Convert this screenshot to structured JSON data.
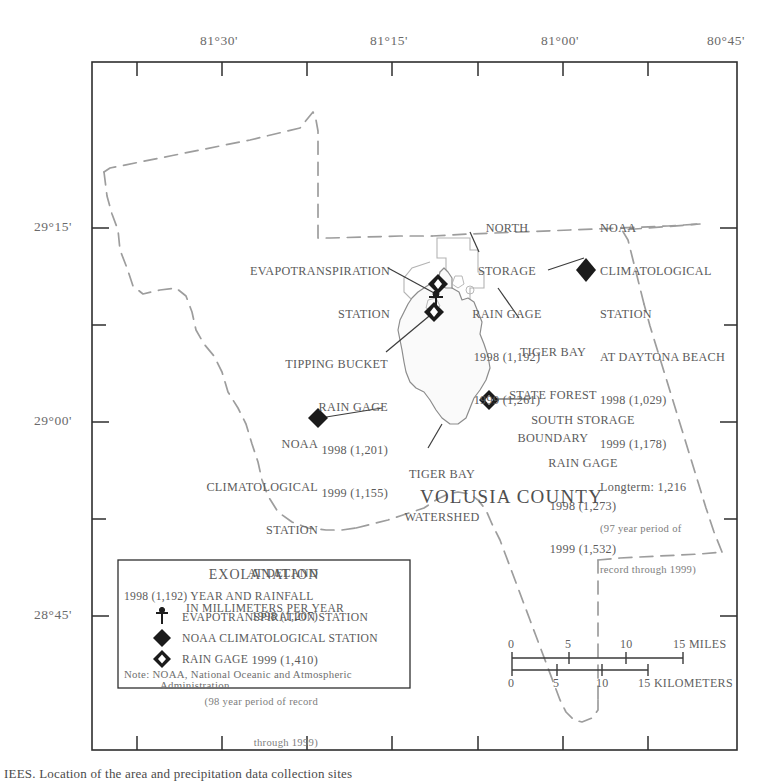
{
  "figure": {
    "county_label": "VOLUSIA COUNTY",
    "caption_partial": "IEES. Location of  the  area  and  precipitation  data  collection  sites"
  },
  "axes": {
    "longitude_ticks": [
      "81°30'",
      "81°15'",
      "81°00'",
      "80°45'"
    ],
    "latitude_ticks": [
      "29°15'",
      "29°00'",
      "28°45'"
    ]
  },
  "annotations": {
    "evapotranspiration": {
      "line1": "EVAPOTRANSPIRATION",
      "line2": "STATION"
    },
    "north_storage": {
      "line1": "NORTH",
      "line2": "STORAGE",
      "line3": "RAIN GAGE",
      "line4": "1998 (1,192)",
      "line5": "1999 (1,261)"
    },
    "noaa_daytona": {
      "line1": "NOAA",
      "line2": "CLIMATOLOGICAL",
      "line3": "STATION",
      "line4": "AT DAYTONA BEACH",
      "line5": "1998 (1,029)",
      "line6": "1999 (1,178)",
      "line7": "Longterm: 1,216",
      "line8": "(97 year period of",
      "line9": "record through 1999)"
    },
    "tipping_bucket": {
      "line1": "TIPPING BUCKET",
      "line2": "RAIN GAGE",
      "line3": "1998 (1,201)",
      "line4": "1999 (1,155)"
    },
    "tiger_bay_forest": {
      "line1": "TIGER BAY",
      "line2": "STATE FOREST",
      "line3": "BOUNDARY"
    },
    "south_storage": {
      "line1": "SOUTH STORAGE",
      "line2": "RAIN GAGE",
      "line3": "1998 (1,273)",
      "line4": "1999 (1,532)"
    },
    "noaa_deland": {
      "line1": "NOAA",
      "line2": "CLIMATOLOGICAL",
      "line3": "STATION",
      "line4": "AT DELAND",
      "line5": "1998 (1,207)",
      "line6": "1999 (1,410)",
      "line7": "(98 year period of record",
      "line8": "through 1999)"
    },
    "tiger_bay_watershed": {
      "line1": "TIGER BAY",
      "line2": "WATERSHED"
    }
  },
  "legend": {
    "title": "EXOLANATION",
    "value_line1": "1998 (1,192) YEAR AND RAINFALL",
    "value_line2": "IN MILLIMETERS PER YEAR",
    "items": [
      {
        "symbol": "evapotranspiration-station-symbol",
        "label": "EVAPOTRANSPIRATION STATION"
      },
      {
        "symbol": "noaa-climatological-station-symbol",
        "label": "NOAA CLIMATOLOGICAL STATION"
      },
      {
        "symbol": "rain-gage-symbol",
        "label": "RAIN GAGE"
      }
    ],
    "note_line1": "Note: NOAA, National Oceanic and Atmospheric",
    "note_line2": "Administration"
  },
  "scalebar": {
    "miles_ticks": [
      "0",
      "5",
      "10",
      "15 MILES"
    ],
    "kilometers_ticks": [
      "0",
      "5",
      "10",
      "15 KILOMETERS"
    ]
  },
  "colors": {
    "ink": "#4a4a4a",
    "label": "#5b5b5b",
    "faint": "#9a9a9a",
    "frame": "#2e2e2e",
    "dash": "#9d9d9d",
    "paper": "#ffffff"
  }
}
